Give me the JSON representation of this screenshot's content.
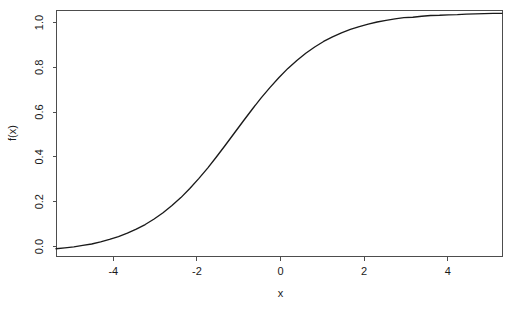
{
  "chart_data": {
    "type": "line",
    "title": "",
    "subtitle": "",
    "xlabel": "x",
    "ylabel": "f(x)",
    "xlim": [
      -5,
      5
    ],
    "ylim": [
      -0.012,
      1.012
    ],
    "grid": false,
    "legend": false,
    "legend_position": "none",
    "xticks": [
      -4,
      -2,
      0,
      2,
      4
    ],
    "xtick_labels": [
      "-4",
      "-2",
      "0",
      "2",
      "4"
    ],
    "yticks": [
      0.0,
      0.2,
      0.4,
      0.6,
      0.8,
      1.0
    ],
    "ytick_labels": [
      "0.0",
      "0.2",
      "0.4",
      "0.6",
      "0.8",
      "1.0"
    ],
    "series": [
      {
        "name": "f(x)",
        "color": "#1a1a1a",
        "x": [
          -5.0,
          -4.8,
          -4.6,
          -4.4,
          -4.2,
          -4.0,
          -3.8,
          -3.6,
          -3.4,
          -3.2,
          -3.0,
          -2.8,
          -2.6,
          -2.4,
          -2.2,
          -2.0,
          -1.8,
          -1.6,
          -1.4,
          -1.2,
          -1.0,
          -0.8,
          -0.6,
          -0.4,
          -0.2,
          0.0,
          0.2,
          0.4,
          0.6,
          0.8,
          1.0,
          1.2,
          1.4,
          1.6,
          1.8,
          2.0,
          2.2,
          2.4,
          2.6,
          2.8,
          3.0,
          3.2,
          3.4,
          3.6,
          3.8,
          4.0,
          4.2,
          4.4,
          4.6,
          4.8,
          5.0
        ],
        "y": [
          0.018,
          0.022,
          0.026,
          0.032,
          0.038,
          0.047,
          0.057,
          0.069,
          0.083,
          0.1,
          0.119,
          0.142,
          0.168,
          0.198,
          0.231,
          0.269,
          0.31,
          0.354,
          0.401,
          0.45,
          0.5,
          0.55,
          0.599,
          0.646,
          0.69,
          0.731,
          0.769,
          0.802,
          0.832,
          0.858,
          0.881,
          0.9,
          0.917,
          0.931,
          0.943,
          0.953,
          0.962,
          0.969,
          0.975,
          0.98,
          0.982,
          0.986,
          0.989,
          0.99,
          0.992,
          0.993,
          0.995,
          0.996,
          0.997,
          0.998,
          0.998
        ]
      }
    ],
    "equation": "f(x) = 1 / (1 + exp(-(x + 1)))",
    "plot_box": {
      "left": 56,
      "top": 10,
      "right": 502,
      "bottom": 256
    },
    "background_color": "#ffffff",
    "axis_color": "#4d4d4d"
  }
}
